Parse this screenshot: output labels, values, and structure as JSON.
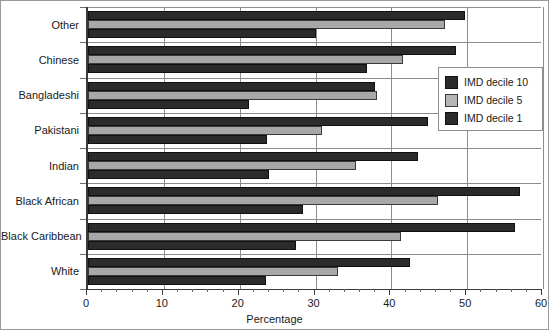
{
  "chart_data": {
    "type": "bar",
    "orientation": "horizontal",
    "title": "",
    "xlabel": "Percentage",
    "ylabel": "",
    "xlim": [
      0,
      60
    ],
    "xticks": [
      0,
      10,
      20,
      30,
      40,
      50,
      60
    ],
    "xtick_labels": [
      "0",
      "10",
      "20",
      "30",
      "40",
      "50",
      "60"
    ],
    "minor_tick_step": 2,
    "grid": true,
    "grid_axis": "x",
    "legend_position": "right-upper",
    "categories": [
      "Other",
      "Chinese",
      "Bangladeshi",
      "Pakistani",
      "Indian",
      "Black African",
      "Black Caribbean",
      "White"
    ],
    "series": [
      {
        "name": "IMD decile 10",
        "color": "#2b2b2b",
        "values": [
          49.7,
          48.5,
          37.9,
          44.9,
          43.5,
          57.0,
          56.3,
          42.5
        ]
      },
      {
        "name": "IMD decile 5",
        "color": "#a8a8a8",
        "values": [
          47.1,
          41.6,
          38.1,
          30.9,
          35.4,
          46.2,
          41.3,
          33.0
        ]
      },
      {
        "name": "IMD decile 1",
        "color": "#2b2b2b",
        "values": [
          30.1,
          36.8,
          21.2,
          23.6,
          23.9,
          28.4,
          27.4,
          23.5
        ]
      }
    ]
  },
  "legend": {
    "items": [
      {
        "label": "IMD decile 10",
        "swatch": "dark"
      },
      {
        "label": "IMD decile 5",
        "swatch": "grey"
      },
      {
        "label": "IMD decile 1",
        "swatch": "dark"
      }
    ]
  },
  "axis": {
    "x_title": "Percentage"
  }
}
